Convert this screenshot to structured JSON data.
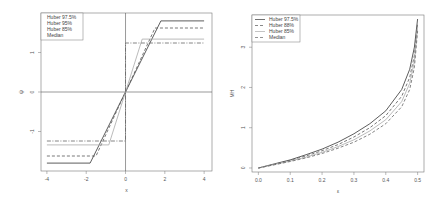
{
  "chart_data": [
    {
      "type": "line",
      "title": "",
      "xlabel": "x",
      "ylabel": "ψ",
      "xlim": [
        -4.3,
        4.4
      ],
      "ylim": [
        -2.0,
        2.0
      ],
      "xticks": [
        "-4",
        "-2",
        "0",
        "2",
        "4"
      ],
      "yticks": [
        "-1",
        "0",
        "1"
      ],
      "grid": false,
      "reference_lines": {
        "h": 0,
        "v": 0
      },
      "legend_position": "top-left",
      "series": [
        {
          "name": "Huber 97.5%",
          "style": "solid",
          "color": "#333333",
          "x": [
            -4,
            -1.8,
            1.8,
            4
          ],
          "y": [
            -1.8,
            -1.8,
            1.8,
            1.8
          ]
        },
        {
          "name": "Huber 95%",
          "style": "dashed",
          "color": "#555555",
          "x": [
            -4,
            -1.5,
            1.5,
            4
          ],
          "y": [
            -1.62,
            -1.62,
            1.62,
            1.62
          ]
        },
        {
          "name": "Huber 85%",
          "style": "solid",
          "color": "#aaaaaa",
          "x": [
            -4,
            -0.85,
            0.85,
            4
          ],
          "y": [
            -1.34,
            -1.34,
            1.34,
            1.34
          ]
        },
        {
          "name": "Median",
          "style": "dashdot",
          "color": "#666666",
          "x": [
            -4,
            0,
            0,
            4
          ],
          "y": [
            -1.24,
            -1.24,
            1.24,
            1.24
          ]
        }
      ]
    },
    {
      "type": "line",
      "title": "",
      "xlabel": "ε",
      "ylabel": "MH",
      "xlim": [
        -0.02,
        0.52
      ],
      "ylim": [
        -0.1,
        3.8
      ],
      "xticks": [
        "0.0",
        "0.1",
        "0.2",
        "0.3",
        "0.4",
        "0.5"
      ],
      "yticks": [
        "0",
        "1",
        "2",
        "3"
      ],
      "grid": false,
      "legend_position": "top-left",
      "x": [
        0.0,
        0.05,
        0.1,
        0.15,
        0.2,
        0.25,
        0.3,
        0.35,
        0.4,
        0.45,
        0.475,
        0.49,
        0.5
      ],
      "series": [
        {
          "name": "Huber 97.5%",
          "style": "solid",
          "color": "#333333",
          "values": [
            0.0,
            0.1,
            0.2,
            0.33,
            0.47,
            0.64,
            0.85,
            1.1,
            1.42,
            1.95,
            2.45,
            3.0,
            3.7
          ]
        },
        {
          "name": "Huber 88%",
          "style": "dashed",
          "color": "#555555",
          "values": [
            0.0,
            0.09,
            0.19,
            0.3,
            0.43,
            0.58,
            0.77,
            1.0,
            1.3,
            1.78,
            2.25,
            2.8,
            3.6
          ]
        },
        {
          "name": "Huber 85%",
          "style": "solid",
          "color": "#aaaaaa",
          "values": [
            0.0,
            0.085,
            0.17,
            0.27,
            0.39,
            0.53,
            0.7,
            0.92,
            1.2,
            1.65,
            2.1,
            2.65,
            3.5
          ]
        },
        {
          "name": "Median",
          "style": "dashed",
          "color": "#666666",
          "values": [
            0.0,
            0.08,
            0.16,
            0.25,
            0.36,
            0.49,
            0.64,
            0.84,
            1.1,
            1.52,
            1.95,
            2.5,
            3.4
          ]
        }
      ]
    }
  ],
  "left_legend": [
    "Huber 97.5%",
    "Huber 95%",
    "Huber 85%",
    "Median"
  ],
  "right_legend": [
    "Huber 97.5%",
    "Huber 88%",
    "Huber 85%",
    "Median"
  ]
}
